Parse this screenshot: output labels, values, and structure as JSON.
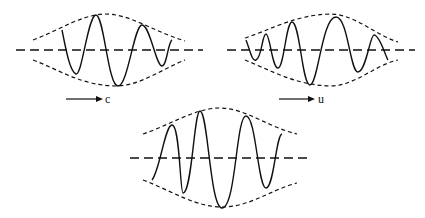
{
  "figure": {
    "type": "wave-packet-diagram",
    "panels": [
      {
        "id": "top-left",
        "arrow_label": "c",
        "description": "wave packet with phase velocity arrow"
      },
      {
        "id": "top-right",
        "arrow_label": "u",
        "description": "wave packet with group velocity arrow"
      },
      {
        "id": "bottom-center",
        "arrow_label": "",
        "description": "wave packet at later time"
      }
    ],
    "colors": {
      "stroke": "#111111",
      "background": "#ffffff"
    }
  }
}
